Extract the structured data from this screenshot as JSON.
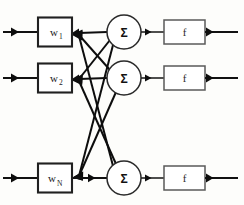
{
  "diagram": {
    "canvas": {
      "width": 244,
      "height": 205,
      "background": "#fdfdfb"
    },
    "colors": {
      "line": "#111111",
      "weight_box_border": "#202020",
      "function_box_border": "#5a5a5a",
      "circle_border": "#2a2a2a",
      "text": "#1a1a1a",
      "fill": "#ffffff"
    },
    "rows": [
      {
        "id": "row-1",
        "y": 32,
        "weight_label": "w",
        "weight_subscript": "1",
        "sum_label": "Σ",
        "function_label": "f"
      },
      {
        "id": "row-2",
        "y": 78,
        "weight_label": "w",
        "weight_subscript": "2",
        "sum_label": "Σ",
        "function_label": "f"
      },
      {
        "id": "row-3",
        "y": 178,
        "weight_label": "w",
        "weight_subscript": "N",
        "sum_label": "Σ",
        "function_label": "f"
      }
    ],
    "geometry": {
      "weight_box": {
        "x": 38,
        "width": 34,
        "height": 29
      },
      "sum_circle": {
        "cx": 124,
        "r": 17
      },
      "function_box": {
        "x": 164,
        "width": 41,
        "height": 24
      },
      "input_arrow_x": 10,
      "input_line_end": 38,
      "output_line_end": 238
    },
    "connections": [
      {
        "from": "sum-1",
        "to": "weight-1"
      },
      {
        "from": "sum-1",
        "to": "weight-2"
      },
      {
        "from": "sum-1",
        "to": "weight-N"
      },
      {
        "from": "sum-2",
        "to": "weight-1"
      },
      {
        "from": "sum-2",
        "to": "weight-2"
      },
      {
        "from": "sum-2",
        "to": "weight-N"
      },
      {
        "from": "sum-3",
        "to": "weight-1"
      },
      {
        "from": "sum-3",
        "to": "weight-2"
      },
      {
        "from": "sum-3",
        "to": "weight-N"
      }
    ]
  }
}
